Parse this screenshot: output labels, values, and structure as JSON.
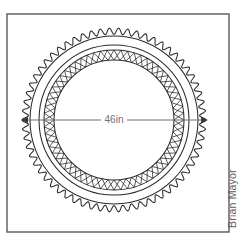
{
  "canvas": {
    "width": 245,
    "height": 242,
    "background": "#ffffff"
  },
  "frame": {
    "name": "drawing-border",
    "x": 7,
    "y": 14,
    "width": 222,
    "height": 218,
    "stroke": "#5a5a5a"
  },
  "diagram": {
    "center_x": 114,
    "center_y": 120,
    "rings": [
      {
        "name": "scalloped-outer-edge",
        "type": "scallop",
        "radius": 92,
        "scallops": 62,
        "amplitude": 3.2,
        "stroke": "#2b2b2b"
      },
      {
        "name": "outer-circle",
        "type": "circle",
        "radius": 84,
        "stroke": "#2b2b2b"
      },
      {
        "name": "inner-circle",
        "type": "circle",
        "radius": 75,
        "stroke": "#2b2b2b"
      },
      {
        "name": "braid-band-outer-circle",
        "type": "circle",
        "radius": 70,
        "stroke": "#2b2b2b"
      },
      {
        "name": "braid-band-inner-circle",
        "type": "circle",
        "radius": 60,
        "stroke": "#2b2b2b"
      }
    ],
    "braid_band": {
      "name": "lattice-braid-band",
      "outer_radius": 70,
      "inner_radius": 60,
      "crossings": 64,
      "stroke": "#232323"
    }
  },
  "dimension": {
    "name": "diameter-dimension",
    "label": "46in",
    "value": 46,
    "unit": "in",
    "y": 120,
    "x_start": 21,
    "x_end": 208,
    "label_x": 114,
    "color": "#6e6e6e",
    "arrow_color": "#3a3a3a"
  },
  "credit": {
    "name": "author-credit",
    "text": "Brian Mayor",
    "orientation": "vertical-bottom-to-top",
    "x": 236,
    "y": 228,
    "color": "#5f5f5f"
  }
}
